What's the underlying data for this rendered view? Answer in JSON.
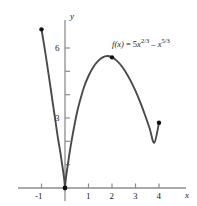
{
  "figure": {
    "name": "function-graph",
    "background": "#ffffff",
    "curve_color": "#4a4a4a",
    "axis_color": "#8c8c8c",
    "point_color": "#111111",
    "text_color": "#1a1a1a"
  },
  "labels": {
    "function_label": "f(x) = 5x2/3 – x5/3",
    "function_label_parts": {
      "fname": "f",
      "arg": "(x)",
      "equals": " = 5",
      "var1": "x",
      "exp1": "2/3",
      "minus": " – ",
      "var2": "x",
      "exp2": "5/3"
    },
    "x_axis": "x",
    "y_axis": "y"
  },
  "chart_data": {
    "type": "line",
    "title": "",
    "xlabel": "x",
    "ylabel": "y",
    "function": "f(x) = 5x^(2/3) - x^(5/3)",
    "xlim": [
      -1.3,
      4.6
    ],
    "ylim": [
      -0.6,
      7.4
    ],
    "grid": false,
    "legend": "none",
    "xticks": [
      -1,
      1,
      2,
      3,
      4
    ],
    "xtick_labels": [
      "-1",
      "1",
      "2",
      "3",
      "4"
    ],
    "yticks": [
      1,
      2,
      3,
      4,
      5,
      6
    ],
    "ytick_labels": [
      "",
      "",
      "3",
      "",
      "",
      "6"
    ],
    "annotations": [
      {
        "text": "f(x) = 5x2/3 – x5/3",
        "x": 2.0,
        "y": 6.4
      }
    ],
    "marked_points": [
      {
        "x": -1,
        "y": 6.8,
        "label": "left-endpoint"
      },
      {
        "x": 2,
        "y": 5.6,
        "label": "local-maximum"
      },
      {
        "x": 4,
        "y": 2.8,
        "label": "right-endpoint"
      }
    ],
    "cusp": {
      "x": 0,
      "y": 0
    },
    "x": [
      -1.0,
      -0.9,
      -0.8,
      -0.7,
      -0.6,
      -0.5,
      -0.4,
      -0.3,
      -0.2,
      -0.12,
      -0.06,
      -0.02,
      0.0,
      0.02,
      0.06,
      0.12,
      0.2,
      0.3,
      0.4,
      0.5,
      0.6,
      0.8,
      1.0,
      1.2,
      1.4,
      1.6,
      1.8,
      2.0,
      2.2,
      2.4,
      2.6,
      2.8,
      3.0,
      3.2,
      3.4,
      3.6,
      3.8,
      4.0
    ],
    "y": [
      6.8,
      6.2,
      5.56,
      4.88,
      4.2,
      3.5,
      2.82,
      2.14,
      1.54,
      1.0,
      0.58,
      0.24,
      0.0,
      0.24,
      0.58,
      1.0,
      1.54,
      2.14,
      2.68,
      3.18,
      3.6,
      4.3,
      4.8,
      5.18,
      5.44,
      5.6,
      5.66,
      5.6,
      5.46,
      5.24,
      4.94,
      4.58,
      4.16,
      3.68,
      3.14,
      2.56,
      1.94,
      2.8
    ]
  }
}
